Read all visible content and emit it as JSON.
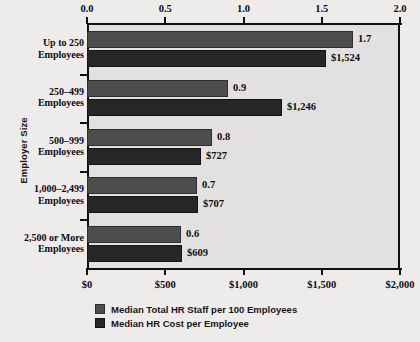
{
  "chart_data": {
    "type": "bar",
    "orientation": "horizontal",
    "title": "",
    "ylabel": "Employer Size",
    "xlabel_top": "",
    "xlabel_bottom": "",
    "categories": [
      "Up to 250 Employees",
      "250–499 Employees",
      "500–999 Employees",
      "1,000–2,499 Employees",
      "2,500 or More Employees"
    ],
    "category_lines": [
      [
        "Up to 250",
        "Employees"
      ],
      [
        "250–499",
        "Employees"
      ],
      [
        "500–999",
        "Employees"
      ],
      [
        "1,000–2,499",
        "Employees"
      ],
      [
        "2,500 or More",
        "Employees"
      ]
    ],
    "series": [
      {
        "name": "Median Total HR Staff per 100 Employees",
        "axis": "top",
        "color": "#4d4d4d",
        "values": [
          1.7,
          0.9,
          0.8,
          0.7,
          0.6
        ],
        "labels": [
          "1.7",
          "0.9",
          "0.8",
          "0.7",
          "0.6"
        ]
      },
      {
        "name": "Median HR Cost per Employee",
        "axis": "bottom",
        "color": "#262626",
        "values": [
          1524,
          1246,
          727,
          707,
          609
        ],
        "labels": [
          "$1,524",
          "$1,246",
          "$727",
          "$707",
          "$609"
        ]
      }
    ],
    "axis_top": {
      "ticks": [
        0.0,
        0.5,
        1.0,
        1.5,
        2.0
      ],
      "tick_labels": [
        "0.0",
        "0.5",
        "1.0",
        "1.5",
        "2.0"
      ],
      "min": 0.0,
      "max": 2.0
    },
    "axis_bottom": {
      "ticks": [
        0,
        500,
        1000,
        1500,
        2000
      ],
      "tick_labels": [
        "$0",
        "$500",
        "$1,000",
        "$1,500",
        "$2,000"
      ],
      "min": 0,
      "max": 2000
    },
    "grid": false,
    "legend_position": "bottom",
    "plot_background": "#e2e1df",
    "page_background": "#edecea"
  }
}
